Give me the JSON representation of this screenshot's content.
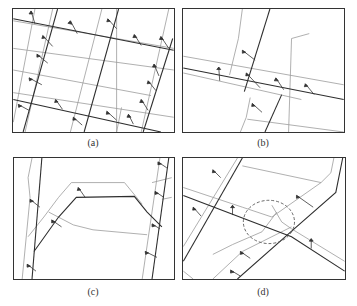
{
  "figure": {
    "panels": [
      {
        "id": "a",
        "caption": "(a)",
        "description": "Grid road network with direction arrows along major roads"
      },
      {
        "id": "b",
        "caption": "(b)",
        "description": "Crossing of two roads with direction arrows"
      },
      {
        "id": "c",
        "caption": "(c)",
        "description": "Curved road between two parallel roads with direction arrows"
      },
      {
        "id": "d",
        "caption": "(d)",
        "description": "Diagonal roads with dashed circle marking an intersection region"
      }
    ],
    "colors": {
      "frame": "#333333",
      "major_road": "#2e2e2e",
      "minor_road": "#9a9a9a",
      "arrow": "#333333",
      "highlight_circle": "#555555"
    }
  }
}
